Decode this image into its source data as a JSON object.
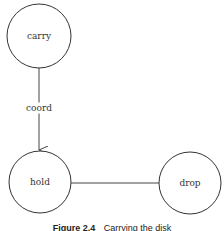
{
  "diagram": {
    "nodes": [
      {
        "id": "carry",
        "label": "carry",
        "cx": 39,
        "cy": 36,
        "r": 32
      },
      {
        "id": "hold",
        "label": "hold",
        "cx": 40,
        "cy": 182,
        "r": 31
      },
      {
        "id": "drop",
        "label": "drop",
        "cx": 190,
        "cy": 183,
        "r": 31
      }
    ],
    "edges": [
      {
        "from": "carry",
        "to": "hold",
        "label": "coord",
        "directed": true
      },
      {
        "from": "hold",
        "to": "drop",
        "label": "",
        "directed": false
      }
    ],
    "caption": {
      "figure_number": "Figure 2.4",
      "text": "Carrying the disk"
    }
  }
}
